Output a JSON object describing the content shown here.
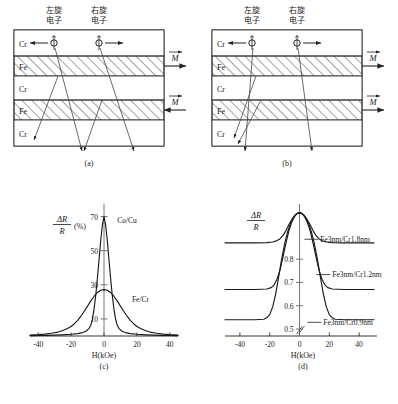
{
  "figure": {
    "caption_a": "(a)",
    "caption_b": "(b)",
    "caption_c": "(c)",
    "caption_d": "(d)",
    "bottom_caption": ""
  },
  "panel_a": {
    "name": "antiparallel-magnetization-multilayer",
    "spin_labels": {
      "left": "左旋\n电子",
      "left_line1": "左旋",
      "left_line2": "电子",
      "right_line1": "右旋",
      "right_line2": "电子"
    },
    "layers": [
      {
        "material": "Cr",
        "hatched": false
      },
      {
        "material": "Fe",
        "hatched": true
      },
      {
        "material": "Cr",
        "hatched": false
      },
      {
        "material": "Fe",
        "hatched": true
      },
      {
        "material": "Cr",
        "hatched": false
      }
    ],
    "magnetization_labels": [
      "M",
      "M"
    ],
    "magnetization_directions": [
      "right",
      "left"
    ]
  },
  "panel_b": {
    "name": "parallel-magnetization-multilayer",
    "spin_labels": {
      "left_line1": "左旋",
      "left_line2": "电子",
      "right_line1": "右旋",
      "right_line2": "电子"
    },
    "layers": [
      {
        "material": "Cr",
        "hatched": false
      },
      {
        "material": "Fe",
        "hatched": true
      },
      {
        "material": "Cr",
        "hatched": false
      },
      {
        "material": "Fe",
        "hatched": true
      },
      {
        "material": "Cr",
        "hatched": false
      }
    ],
    "magnetization_labels": [
      "M",
      "M"
    ],
    "magnetization_directions": [
      "right",
      "right"
    ]
  },
  "chart_data": [
    {
      "id": "chart-c",
      "type": "line",
      "title": "",
      "xlabel": "H(kOe)",
      "ylabel_num": "ΔR",
      "ylabel_den": "R",
      "ylabel_unit": "(%)",
      "xlim": [
        -45,
        45
      ],
      "ylim": [
        0,
        75
      ],
      "xticks": [
        -40,
        -20,
        0,
        20,
        40
      ],
      "xticklabels": [
        "-40",
        "-20",
        "0",
        "20",
        "40"
      ],
      "yticks": [
        10,
        30,
        50,
        70
      ],
      "yticklabels": [
        "10",
        "30",
        "50",
        "70"
      ],
      "grid": false,
      "legend": "inline-annotations",
      "series": [
        {
          "name": "Co/Cu",
          "label_x": 8,
          "label_y": 66,
          "x": [
            -45,
            -40,
            -35,
            -30,
            -25,
            -20,
            -16,
            -13,
            -11,
            -9,
            -8,
            -7,
            -6,
            -5,
            -4,
            -3,
            -2,
            -1,
            0,
            1,
            2,
            3,
            4,
            5,
            6,
            7,
            8,
            9,
            11,
            13,
            16,
            20,
            25,
            30,
            35,
            40,
            45
          ],
          "y": [
            0.2,
            0.3,
            0.4,
            0.5,
            0.7,
            1.0,
            1.4,
            2.0,
            2.8,
            4.5,
            6.5,
            10,
            16,
            24,
            34,
            45,
            56,
            65,
            70,
            65,
            56,
            45,
            34,
            24,
            16,
            10,
            6.5,
            4.5,
            2.8,
            2.0,
            1.4,
            1.0,
            0.7,
            0.5,
            0.4,
            0.3,
            0.2
          ]
        },
        {
          "name": "Fe/Cr",
          "label_x": 17,
          "label_y": 20,
          "x": [
            -45,
            -40,
            -36,
            -32,
            -28,
            -25,
            -22,
            -20,
            -18,
            -16,
            -14,
            -12,
            -10,
            -8,
            -6,
            -4,
            -2,
            0,
            2,
            4,
            6,
            8,
            10,
            12,
            14,
            16,
            18,
            20,
            22,
            25,
            28,
            32,
            36,
            40,
            45
          ],
          "y": [
            0.6,
            0.8,
            1.1,
            1.6,
            2.3,
            3.2,
            4.5,
            5.6,
            7.2,
            9.2,
            11.6,
            14.5,
            17.5,
            20.6,
            23.3,
            25.5,
            26.8,
            27.2,
            26.8,
            25.5,
            23.3,
            20.6,
            17.5,
            14.5,
            11.6,
            9.2,
            7.2,
            5.6,
            4.5,
            3.2,
            2.3,
            1.6,
            1.1,
            0.8,
            0.6
          ]
        }
      ]
    },
    {
      "id": "chart-d",
      "type": "line",
      "title": "",
      "xlabel": "H(kOe)",
      "ylabel_num": "ΔR",
      "ylabel_den": "R",
      "ylabel_unit": "",
      "xlim": [
        -50,
        52
      ],
      "ylim": [
        0.47,
        1.02
      ],
      "xticks": [
        -40,
        -20,
        0,
        20,
        40
      ],
      "xticklabels": [
        "-40",
        "-20",
        "0",
        "20",
        "40"
      ],
      "yticks": [
        0.5,
        0.6,
        0.7,
        0.8
      ],
      "yticklabels": [
        "0.5",
        "0.6",
        "0.7",
        "0.8"
      ],
      "axis_break": true,
      "grid": false,
      "legend": "inline-annotations",
      "series": [
        {
          "name": "Fe3nm/Cr1.8nm",
          "baseline": 0.87,
          "peak": 1.0,
          "label_x": 14,
          "label_y": 0.875,
          "x": [
            -50,
            -30,
            -22,
            -18,
            -15,
            -13,
            -11,
            -9,
            -7,
            -5,
            -3,
            -1,
            0,
            1,
            3,
            5,
            7,
            9,
            11,
            13,
            15,
            18,
            22,
            30,
            50
          ],
          "y": [
            0.87,
            0.87,
            0.871,
            0.874,
            0.88,
            0.888,
            0.902,
            0.924,
            0.95,
            0.972,
            0.99,
            0.999,
            1.0,
            0.999,
            0.99,
            0.972,
            0.95,
            0.924,
            0.902,
            0.888,
            0.88,
            0.874,
            0.871,
            0.87,
            0.87
          ]
        },
        {
          "name": "Fe3nm/Cr1.2nm",
          "baseline": 0.67,
          "peak": 1.0,
          "label_x": 22,
          "label_y": 0.723,
          "x": [
            -50,
            -30,
            -22,
            -19,
            -17,
            -15,
            -13,
            -11,
            -9,
            -7,
            -5,
            -3,
            -1,
            0,
            1,
            3,
            5,
            7,
            9,
            11,
            13,
            15,
            17,
            19,
            22,
            30,
            50
          ],
          "y": [
            0.67,
            0.67,
            0.672,
            0.678,
            0.69,
            0.715,
            0.755,
            0.812,
            0.872,
            0.925,
            0.963,
            0.987,
            0.998,
            1.0,
            0.998,
            0.987,
            0.963,
            0.925,
            0.872,
            0.812,
            0.755,
            0.715,
            0.69,
            0.678,
            0.672,
            0.67,
            0.67
          ]
        },
        {
          "name": "Fe3nm/Cr0.9nm",
          "baseline": 0.54,
          "peak": 1.0,
          "label_x": 16,
          "label_y": 0.518,
          "x": [
            -50,
            -30,
            -24,
            -22,
            -20,
            -18,
            -16,
            -14,
            -12,
            -10,
            -8,
            -6,
            -4,
            -2,
            0,
            2,
            4,
            6,
            8,
            10,
            12,
            14,
            16,
            18,
            20,
            22,
            24,
            30,
            50
          ],
          "y": [
            0.54,
            0.54,
            0.542,
            0.548,
            0.562,
            0.595,
            0.65,
            0.724,
            0.8,
            0.866,
            0.917,
            0.955,
            0.98,
            0.995,
            1.0,
            0.995,
            0.98,
            0.955,
            0.917,
            0.866,
            0.8,
            0.724,
            0.65,
            0.595,
            0.562,
            0.548,
            0.542,
            0.54,
            0.54
          ]
        }
      ]
    }
  ]
}
